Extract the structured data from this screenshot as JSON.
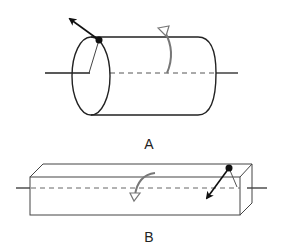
{
  "figures": [
    {
      "id": "A",
      "label": "A",
      "shape": "cylinder",
      "description": "Cylinder rotating about its horizontal axis; a point on the rim has a tangential velocity arrow"
    },
    {
      "id": "B",
      "label": "B",
      "shape": "rectangular-prism",
      "description": "Rectangular bar rotating about its horizontal axis; a point on the top edge has a velocity arrow"
    }
  ],
  "colors": {
    "stroke": "#222222",
    "rotation_arrow": "#777777",
    "axis_dashed": "#555555",
    "background": "#ffffff"
  }
}
